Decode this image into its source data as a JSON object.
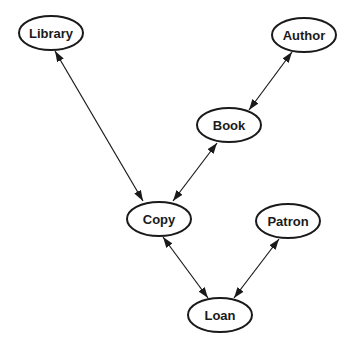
{
  "diagram": {
    "type": "entity-relationship",
    "nodes": [
      {
        "id": "library",
        "label": "Library",
        "cx": 51,
        "cy": 33
      },
      {
        "id": "author",
        "label": "Author",
        "cx": 304,
        "cy": 35
      },
      {
        "id": "book",
        "label": "Book",
        "cx": 229,
        "cy": 125
      },
      {
        "id": "copy",
        "label": "Copy",
        "cx": 159,
        "cy": 218
      },
      {
        "id": "patron",
        "label": "Patron",
        "cx": 288,
        "cy": 220
      },
      {
        "id": "loan",
        "label": "Loan",
        "cx": 220,
        "cy": 315
      }
    ],
    "edges": [
      {
        "from": "library",
        "to": "copy",
        "bidirectional": true
      },
      {
        "from": "author",
        "to": "book",
        "bidirectional": true
      },
      {
        "from": "book",
        "to": "copy",
        "bidirectional": true
      },
      {
        "from": "copy",
        "to": "loan",
        "bidirectional": true
      },
      {
        "from": "patron",
        "to": "loan",
        "bidirectional": true
      }
    ],
    "colors": {
      "stroke": "#1a1a1a",
      "background": "#ffffff"
    }
  }
}
